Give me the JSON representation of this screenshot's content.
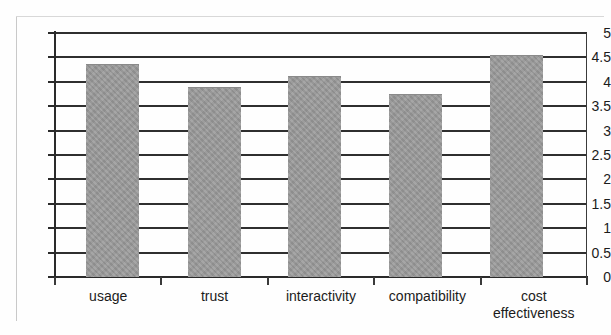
{
  "chart_data": {
    "type": "bar",
    "title": "",
    "subtitle": "",
    "xlabel": "",
    "ylabel": "",
    "categories": [
      "usage",
      "trust",
      "interactivity",
      "compatibility",
      "cost\neffectiveness"
    ],
    "values": [
      4.35,
      3.87,
      4.1,
      3.72,
      4.52
    ],
    "ylim": [
      0,
      5
    ],
    "ytick_labels": [
      "5",
      "4.5",
      "4",
      "3.5",
      "3",
      "2.5",
      "2",
      "1.5",
      "1",
      "0.5",
      "0"
    ],
    "ytick_values": [
      5,
      4.5,
      4,
      3.5,
      3,
      2.5,
      2,
      1.5,
      1,
      0.5,
      0
    ],
    "grid": true,
    "grid_axis": "y",
    "legend": false,
    "legend_position": "none",
    "bar_color": "#9a9a9a",
    "axis_color": "#2a2a2a",
    "gridline_color": "#2f2f2f",
    "background_color": "#ffffff"
  },
  "page": {
    "top_cut_text": "",
    "scan_note": ""
  }
}
